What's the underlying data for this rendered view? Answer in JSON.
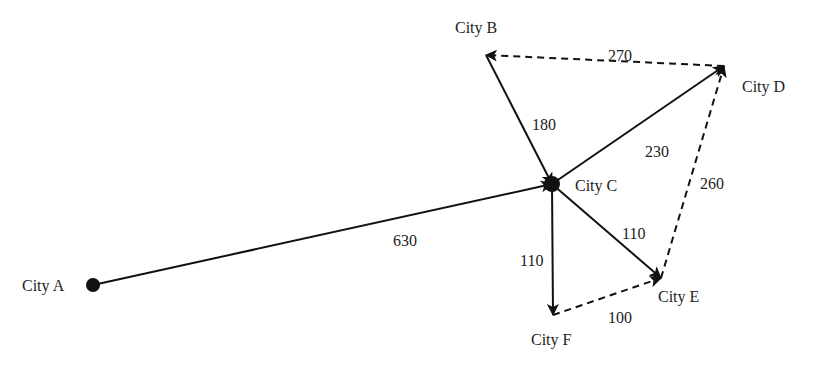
{
  "diagram": {
    "type": "directed-graph",
    "nodes": [
      {
        "id": "A",
        "label": "City A",
        "x": 93,
        "y": 285,
        "lx": 22,
        "ly": 278
      },
      {
        "id": "B",
        "label": "City B",
        "x": 486,
        "y": 55,
        "lx": 455,
        "ly": 20
      },
      {
        "id": "C",
        "label": "City C",
        "x": 552,
        "y": 184,
        "lx": 575,
        "ly": 178
      },
      {
        "id": "D",
        "label": "City D",
        "x": 724,
        "y": 66,
        "lx": 742,
        "ly": 79
      },
      {
        "id": "E",
        "label": "City E",
        "x": 661,
        "y": 278,
        "lx": 658,
        "ly": 289
      },
      {
        "id": "F",
        "label": "City F",
        "x": 553,
        "y": 315,
        "lx": 531,
        "ly": 332
      }
    ],
    "edges": [
      {
        "from": "A",
        "to": "C",
        "weight": "630",
        "style": "solid",
        "lx": 393,
        "ly": 233
      },
      {
        "from": "B",
        "to": "C",
        "weight": "180",
        "style": "solid",
        "lx": 532,
        "ly": 117
      },
      {
        "from": "C",
        "to": "D",
        "weight": "230",
        "style": "solid",
        "lx": 645,
        "ly": 144
      },
      {
        "from": "D",
        "to": "B",
        "weight": "270",
        "style": "dashed",
        "lx": 608,
        "ly": 48
      },
      {
        "from": "E",
        "to": "D",
        "weight": "260",
        "style": "dashed",
        "lx": 700,
        "ly": 176
      },
      {
        "from": "C",
        "to": "E",
        "weight": "110",
        "style": "solid",
        "lx": 622,
        "ly": 226
      },
      {
        "from": "C",
        "to": "F",
        "weight": "110",
        "style": "solid",
        "lx": 520,
        "ly": 253
      },
      {
        "from": "F",
        "to": "E",
        "weight": "100",
        "style": "dashed",
        "lx": 608,
        "ly": 310
      }
    ],
    "colors": {
      "line": "#111111",
      "text": "#222222",
      "background": "#ffffff"
    }
  }
}
